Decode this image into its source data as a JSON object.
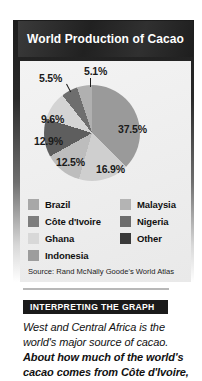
{
  "figure": {
    "title": "World Production of Cacao",
    "source": "Source: Rand McNally Goode's World Atlas"
  },
  "chart_data": {
    "type": "pie",
    "title": "World Production of Cacao",
    "xlabel": "",
    "ylabel": "",
    "unit": "percent",
    "legend_position": "bottom",
    "grid": false,
    "categories": [
      "Côte d'Ivoire",
      "Ghana",
      "Indonesia",
      "Brazil",
      "Nigeria",
      "Malaysia",
      "Other"
    ],
    "values": [
      37.5,
      16.9,
      12.5,
      12.9,
      9.6,
      5.5,
      5.1
    ],
    "labels": [
      "37.5%",
      "16.9%",
      "12.5%",
      "12.9%",
      "9.6%",
      "5.5%",
      "5.1%"
    ],
    "colors": [
      "#9a9a9a",
      "#cfcfcf",
      "#bdbdbd",
      "#5e5e5e",
      "#d4d4d4",
      "#6e6e6e",
      "#b0b0b0"
    ],
    "source": "Source: Rand McNally Goode's World Atlas"
  },
  "slices": {
    "cote": "37.5%",
    "ghana": "16.9%",
    "indonesia": "12.5%",
    "brazil": "12.9%",
    "nigeria": "9.6%",
    "malaysia": "5.5%",
    "other": "5.1%"
  },
  "legend": {
    "left": [
      {
        "label": "Brazil",
        "color": "#a8a8a8"
      },
      {
        "label": "Côte d'Ivoire",
        "color": "#7d7d7d"
      },
      {
        "label": "Ghana",
        "color": "#d8d8d8"
      },
      {
        "label": "Indonesia",
        "color": "#9d9d9d"
      }
    ],
    "right": [
      {
        "label": "Malaysia",
        "color": "#b4b4b4"
      },
      {
        "label": "Nigeria",
        "color": "#6d6d6d"
      },
      {
        "label": "Other",
        "color": "#3a3a3a"
      }
    ]
  },
  "interpreting": {
    "heading": "INTERPRETING THE GRAPH",
    "line1": "West and Central Africa is the",
    "line2": "world's major source of cacao.",
    "line3": "About how much of the world's",
    "line4": "cacao comes from Côte d'Ivoire,"
  }
}
